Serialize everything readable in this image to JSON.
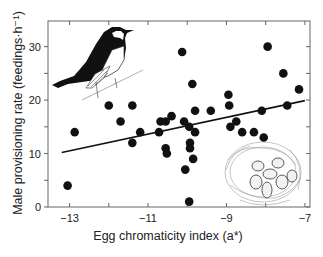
{
  "chart_data": {
    "type": "scatter",
    "title": "",
    "xlabel": "Egg chromaticity index (a*)",
    "ylabel": "Male provisioning rate (feedings·h⁻¹)",
    "xlim": [
      -13.55,
      -6.87
    ],
    "ylim": [
      0,
      34.8
    ],
    "xticks": [
      -13,
      -11,
      -9,
      -7
    ],
    "xtick_labels": [
      "−13",
      "−11",
      "−9",
      "−7"
    ],
    "xminor_ticks": [
      -12,
      -10,
      -8
    ],
    "yticks": [
      0,
      10,
      20,
      30
    ],
    "ytick_labels": [
      "0",
      "10",
      "20",
      "30"
    ],
    "yminor_ticks": [
      5,
      15,
      25
    ],
    "grid": false,
    "legend": null,
    "points": [
      {
        "x": -13.05,
        "y": 4
      },
      {
        "x": -12.87,
        "y": 14
      },
      {
        "x": -12.0,
        "y": 19
      },
      {
        "x": -11.7,
        "y": 16
      },
      {
        "x": -11.4,
        "y": 19
      },
      {
        "x": -11.4,
        "y": 12
      },
      {
        "x": -11.2,
        "y": 14
      },
      {
        "x": -10.72,
        "y": 14
      },
      {
        "x": -10.68,
        "y": 16
      },
      {
        "x": -10.55,
        "y": 16
      },
      {
        "x": -10.55,
        "y": 11
      },
      {
        "x": -10.52,
        "y": 10
      },
      {
        "x": -10.4,
        "y": 17
      },
      {
        "x": -10.13,
        "y": 29
      },
      {
        "x": -10.08,
        "y": 16
      },
      {
        "x": -10.05,
        "y": 7
      },
      {
        "x": -9.95,
        "y": 15
      },
      {
        "x": -9.93,
        "y": 12
      },
      {
        "x": -9.93,
        "y": 11
      },
      {
        "x": -9.95,
        "y": 1
      },
      {
        "x": -9.87,
        "y": 23
      },
      {
        "x": -9.85,
        "y": 9
      },
      {
        "x": -9.8,
        "y": 18
      },
      {
        "x": -9.8,
        "y": 14
      },
      {
        "x": -9.4,
        "y": 18
      },
      {
        "x": -8.95,
        "y": 21
      },
      {
        "x": -8.93,
        "y": 19
      },
      {
        "x": -8.9,
        "y": 15
      },
      {
        "x": -8.75,
        "y": 16
      },
      {
        "x": -8.6,
        "y": 14
      },
      {
        "x": -8.3,
        "y": 14
      },
      {
        "x": -8.1,
        "y": 18
      },
      {
        "x": -8.05,
        "y": 13
      },
      {
        "x": -7.95,
        "y": 30
      },
      {
        "x": -7.55,
        "y": 25
      },
      {
        "x": -7.45,
        "y": 19
      },
      {
        "x": -7.15,
        "y": 22
      }
    ],
    "regression_line": {
      "x0": -13.2,
      "y0": 10.2,
      "x1": -7.0,
      "y1": 19.9
    },
    "annotations": [
      "illustration: pied flycatcher bird perched on twig (top-left)",
      "illustration: nest with blue-green eggs (bottom-right)"
    ]
  },
  "colors": {
    "point": "#111111",
    "line": "#111111",
    "axis": "#555555",
    "text": "#222222"
  }
}
